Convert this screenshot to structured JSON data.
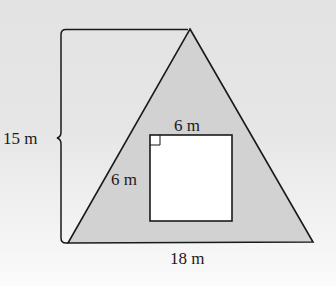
{
  "figure": {
    "type": "triangle-with-square-cutout",
    "colors": {
      "background_top": "#e3e3e3",
      "background_bottom": "#fbfbfb",
      "triangle_fill": "#d2d2d2",
      "square_fill": "#ffffff",
      "stroke": "#1a1a1a"
    },
    "triangle": {
      "height_label": "15 m",
      "base_label": "18 m"
    },
    "square": {
      "top_label": "6 m",
      "side_label": "6 m",
      "right_angle_marker": true
    }
  }
}
